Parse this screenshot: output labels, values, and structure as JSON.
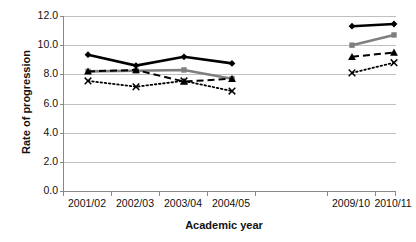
{
  "chart_data": {
    "type": "line",
    "title": "",
    "xlabel": "Academic year",
    "ylabel": "Rate of progression",
    "categories": [
      "2001/02",
      "2002/03",
      "2003/04",
      "2004/05",
      "",
      "2009/10",
      "2010/11"
    ],
    "ylim": [
      0.0,
      12.0
    ],
    "ytick_labels": [
      "0.0",
      "2.0",
      "4.0",
      "6.0",
      "8.0",
      "10.0",
      "12.0"
    ],
    "ytick_values": [
      0.0,
      2.0,
      4.0,
      6.0,
      8.0,
      10.0,
      12.0
    ],
    "grid": true,
    "legend": "none",
    "gap_after_index": 3,
    "series": [
      {
        "name": "series-1",
        "marker": "diamond",
        "line_style": "solid",
        "color": "#000000",
        "values": [
          9.35,
          8.6,
          9.2,
          8.75,
          null,
          11.3,
          11.45
        ]
      },
      {
        "name": "series-2",
        "marker": "square",
        "line_style": "solid",
        "color": "#7f7f7f",
        "values": [
          8.2,
          8.25,
          8.3,
          7.7,
          null,
          10.0,
          10.7
        ]
      },
      {
        "name": "series-3",
        "marker": "triangle",
        "line_style": "dashed",
        "color": "#000000",
        "values": [
          8.2,
          8.3,
          7.5,
          7.7,
          null,
          9.2,
          9.5
        ]
      },
      {
        "name": "series-4",
        "marker": "x",
        "line_style": "dotted",
        "color": "#000000",
        "values": [
          7.55,
          7.15,
          7.55,
          6.85,
          null,
          8.1,
          8.8
        ]
      }
    ]
  },
  "axis": {
    "y_title": "Rate of progression",
    "x_title": "Academic year"
  },
  "colors": {
    "grid": "#bfbfbf",
    "axis": "#888888",
    "black_series": "#000000",
    "gray_series": "#7f7f7f",
    "background": "#ffffff"
  }
}
